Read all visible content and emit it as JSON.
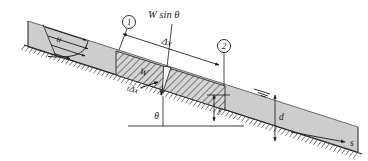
{
  "figure": {
    "type": "engineering-diagram",
    "colors": {
      "fluid_fill": "#cdcdcd",
      "hatch_stroke": "#2b2b2b",
      "line": "#1a1a1a",
      "bed_stroke": "#333333",
      "background": "#ffffff"
    }
  },
  "labels": {
    "velocity_profile": "u",
    "weight_component": "W sin θ",
    "weight": "W",
    "shear_force": "τΔx",
    "length": "Δx",
    "depth_y": "y",
    "depth_d": "d",
    "angle": "θ",
    "axis_s": "s",
    "section_one": "1",
    "section_two": "2"
  },
  "annotations": {
    "section_markers": [
      {
        "id": "1",
        "label": "1"
      },
      {
        "id": "2",
        "label": "2"
      }
    ],
    "forces": [
      {
        "name": "W sin θ",
        "direction": "down-slope-component-of-weight"
      },
      {
        "name": "τΔx",
        "direction": "bed-shear-resisting-flow"
      },
      {
        "name": "W",
        "direction": "weight-of-control-volume"
      }
    ],
    "dimensions": [
      {
        "name": "Δx",
        "between": "section 1 and section 2"
      },
      {
        "name": "y",
        "meaning": "local depth"
      },
      {
        "name": "d",
        "meaning": "total flow depth"
      },
      {
        "name": "θ",
        "meaning": "bed slope angle from horizontal"
      }
    ],
    "axes": [
      {
        "name": "s",
        "meaning": "streamwise coordinate along the bed"
      }
    ]
  }
}
